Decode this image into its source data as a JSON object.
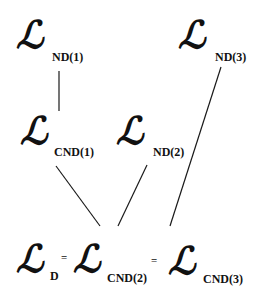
{
  "diagram": {
    "symbol": "ℒ",
    "nodes": {
      "nd1": {
        "symbol": "ℒ",
        "subscript": "ND(1)"
      },
      "nd2": {
        "symbol": "ℒ",
        "subscript": "ND(2)"
      },
      "nd3": {
        "symbol": "ℒ",
        "subscript": "ND(3)"
      },
      "cnd1": {
        "symbol": "ℒ",
        "subscript": "CND(1)"
      },
      "d": {
        "symbol": "ℒ",
        "subscript": "D"
      },
      "cnd2": {
        "symbol": "ℒ",
        "subscript": "CND(2)"
      },
      "cnd3": {
        "symbol": "ℒ",
        "subscript": "CND(3)"
      }
    },
    "equals_sign": "=",
    "equation": "L_D = L_CND(2) = L_CND(3)",
    "edges": [
      {
        "from": "ND(1)",
        "to": "CND(1)"
      },
      {
        "from": "CND(1)",
        "to": "CND(2)"
      },
      {
        "from": "ND(2)",
        "to": "CND(2)"
      },
      {
        "from": "ND(3)",
        "to": "CND(3)"
      }
    ],
    "line_color": "#1a1a1a"
  }
}
